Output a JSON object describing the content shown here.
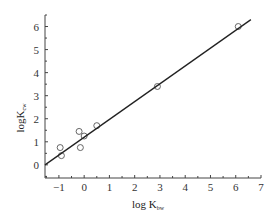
{
  "chart_data": {
    "type": "scatter",
    "title": "",
    "xlabel": "log K_bw",
    "xlabel_main": "log K",
    "xlabel_sub": "bw",
    "ylabel": "logK_cw",
    "ylabel_main": "logK",
    "ylabel_sub": "cw",
    "xlim": [
      -1.55,
      7.0
    ],
    "ylim": [
      -0.57,
      6.5
    ],
    "x_ticks": [
      -1,
      0,
      1,
      2,
      3,
      4,
      5,
      6,
      7
    ],
    "y_ticks": [
      0,
      1,
      2,
      3,
      4,
      5,
      6
    ],
    "x_tick_labels": [
      "−1",
      "0",
      "1",
      "2",
      "3",
      "4",
      "5",
      "6",
      "7"
    ],
    "y_tick_labels": [
      "0",
      "1",
      "2",
      "3",
      "4",
      "5",
      "6"
    ],
    "grid": false,
    "legend": null,
    "series": [
      {
        "name": "observed",
        "marker": "open-circle",
        "x": [
          -0.95,
          -0.9,
          -0.2,
          -0.15,
          0.0,
          0.5,
          2.9,
          6.1
        ],
        "y": [
          0.75,
          0.4,
          1.45,
          0.75,
          1.25,
          1.7,
          3.4,
          6.0
        ]
      },
      {
        "name": "regression-line",
        "type": "line",
        "x": [
          -1.55,
          6.6
        ],
        "y": [
          0.0,
          6.3
        ]
      }
    ]
  },
  "colors": {
    "axis": "#444444",
    "line": "#222222",
    "marker": "#555555"
  }
}
